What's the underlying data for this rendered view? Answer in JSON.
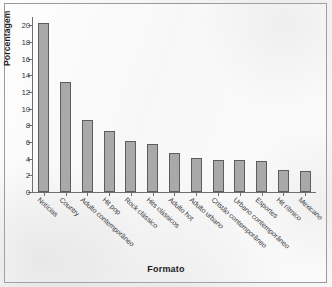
{
  "chart_data": {
    "type": "bar",
    "title": "",
    "xlabel": "Formato",
    "ylabel": "Porcentagem",
    "ylim": [
      0,
      21
    ],
    "yticks": [
      0,
      2,
      4,
      6,
      8,
      10,
      12,
      14,
      16,
      18,
      20
    ],
    "grid": false,
    "legend": null,
    "bar_color": "#a9a9a9",
    "bar_edge_color": "#5d5d5d",
    "categories": [
      "Notícias",
      "Country",
      "Adulto contemporâneo",
      "Hit pop",
      "Rock clássico",
      "Hits clássicos",
      "Adulto hot",
      "Adulto urbano",
      "Cristão contemporâneo",
      "Urbano contemporâneo",
      "Esportes",
      "Hit rítmico",
      "Mexicano"
    ],
    "values": [
      20.3,
      13.2,
      8.6,
      7.3,
      6.1,
      5.8,
      4.7,
      4.1,
      3.9,
      3.8,
      3.7,
      2.6,
      2.5
    ]
  }
}
